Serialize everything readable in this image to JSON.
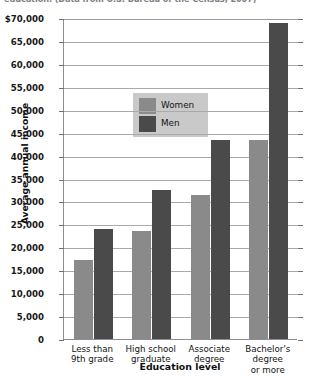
{
  "caption": {
    "text": "education. (Data from U.S. Bureau of the Census, 2007)"
  },
  "chart_data": {
    "type": "bar",
    "title": "",
    "xlabel": "Education level",
    "ylabel": "Average annual income",
    "categories": [
      "Less than\n9th grade",
      "High school\ngraduate",
      "Associate\ndegree",
      "Bachelor's\ndegree\nor more"
    ],
    "series": [
      {
        "name": "Women",
        "color": "#8a8a8a",
        "values": [
          17300,
          23500,
          31500,
          43500
        ]
      },
      {
        "name": "Men",
        "color": "#4a4a4a",
        "values": [
          24000,
          32500,
          43500,
          69000
        ]
      }
    ],
    "ylim": [
      0,
      70000
    ],
    "ytick_step": 5000,
    "ytick_labels": [
      "$70,000",
      "65,000",
      "60,000",
      "55,000",
      "50,000",
      "45,000",
      "40,000",
      "35,000",
      "30,000",
      "25,000",
      "20,000",
      "15,000",
      "10,000",
      "5,000",
      "0"
    ],
    "ytick_values": [
      70000,
      65000,
      60000,
      55000,
      50000,
      45000,
      40000,
      35000,
      30000,
      25000,
      20000,
      15000,
      10000,
      5000,
      0
    ],
    "grid": true,
    "legend_position": "upper-left-inside"
  }
}
